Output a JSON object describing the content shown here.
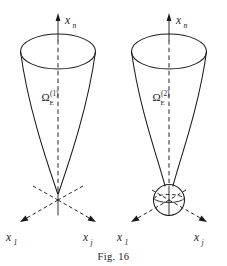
{
  "figure": {
    "caption": "Fig. 16",
    "background_color": "#ffffff",
    "line_color": "#1a1a1a",
    "panels": [
      {
        "id": "panel-left",
        "solid_angle_label": {
          "symbol": "Ω",
          "subscript": "E",
          "superscript": "(1)",
          "full": "Ωₑ⁽¹⁾"
        },
        "apex_shape": "sharp-point",
        "axes": [
          {
            "name": "x-n-axis",
            "label_symbol": "x",
            "label_subscript": "n",
            "direction": "up"
          },
          {
            "name": "x-1-axis",
            "label_symbol": "x",
            "label_subscript": "1",
            "direction": "down-left"
          },
          {
            "name": "x-j-axis",
            "label_symbol": "x",
            "label_subscript": "j",
            "direction": "down-right"
          }
        ]
      },
      {
        "id": "panel-right",
        "solid_angle_label": {
          "symbol": "Ω",
          "subscript": "E",
          "superscript": "(2)",
          "full": "Ωₑ⁽²⁾"
        },
        "apex_shape": "sphere",
        "axes": [
          {
            "name": "x-n-axis",
            "label_symbol": "x",
            "label_subscript": "n",
            "direction": "up"
          },
          {
            "name": "x-1-axis",
            "label_symbol": "x",
            "label_subscript": "1",
            "direction": "down-left"
          },
          {
            "name": "x-j-axis",
            "label_symbol": "x",
            "label_subscript": "j",
            "direction": "down-right"
          }
        ]
      }
    ]
  }
}
